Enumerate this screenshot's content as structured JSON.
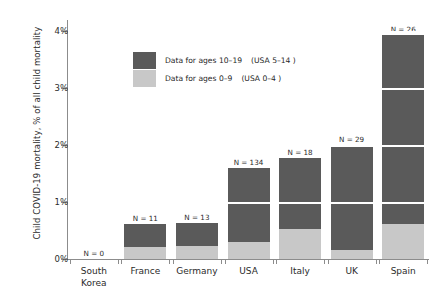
{
  "chart_data": {
    "type": "bar",
    "stacked": true,
    "title": "",
    "xlabel": "",
    "ylabel": "Child COVID-19 mortality, % of all child mortality",
    "ylim": [
      0,
      4.2
    ],
    "yticks": [
      0,
      1,
      2,
      3,
      4
    ],
    "ytick_labels": [
      "0%",
      "1%",
      "2%",
      "3%",
      "4%"
    ],
    "grid": "horizontal-white-over-bars",
    "legend_position": "inside-upper-left",
    "categories": [
      "South Korea",
      "France",
      "Germany",
      "USA",
      "Italy",
      "UK",
      "Spain"
    ],
    "series": [
      {
        "name": "Data for ages 0–9",
        "note": "(USA 0–4 )",
        "color": "#c8c8c8",
        "values": [
          0,
          0.21,
          0.22,
          0.3,
          0.52,
          0.15,
          0.62
        ]
      },
      {
        "name": "Data for ages 10–19",
        "note": "(USA 5–14 )",
        "color": "#5a5a5a",
        "values": [
          0,
          0.41,
          0.41,
          1.3,
          1.25,
          1.85,
          3.31
        ]
      }
    ],
    "totals": [
      0,
      0.62,
      0.63,
      1.6,
      1.77,
      2.0,
      3.93
    ],
    "annotations": [
      {
        "category": "South Korea",
        "text": "N = 0"
      },
      {
        "category": "France",
        "text": "N = 11"
      },
      {
        "category": "Germany",
        "text": "N = 13"
      },
      {
        "category": "USA",
        "text": "N = 134"
      },
      {
        "category": "Italy",
        "text": "N = 18"
      },
      {
        "category": "UK",
        "text": "N = 29"
      },
      {
        "category": "Spain",
        "text": "N = 26"
      }
    ]
  },
  "legend": {
    "rows": [
      {
        "label": "Data for ages 10–19",
        "note": "(USA 5–14 )",
        "color": "#5a5a5a"
      },
      {
        "label": "Data for ages 0–9",
        "note": "(USA 0–4 )",
        "color": "#c8c8c8"
      }
    ]
  },
  "axis": {
    "y_title": "Child COVID-19 mortality, % of all child mortality"
  }
}
